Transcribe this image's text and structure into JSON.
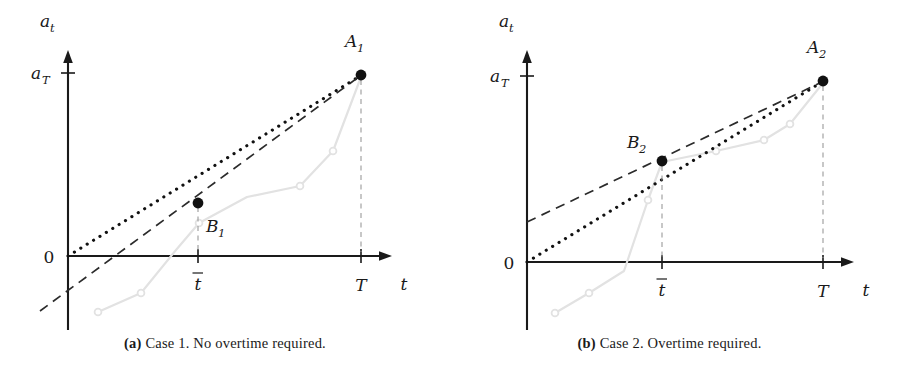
{
  "figure": {
    "background": "#ffffff",
    "ink": "#111111",
    "gray": "#e2e2e2",
    "guide_gray": "#9a9a9a"
  },
  "panels": [
    {
      "id": "a",
      "caption_tag": "(a)",
      "caption_text": "Case 1. No overtime required.",
      "axes": {
        "y_axis_label": "a_t",
        "y_axis_label_main": "a",
        "y_axis_label_sub": "t",
        "x_axis_label": "t",
        "origin_label": "0",
        "y_tick_label_main": "a",
        "y_tick_label_sub": "T",
        "x_ticks": [
          {
            "label_main": "t",
            "overbar": true,
            "label_sub": "",
            "x": 198
          },
          {
            "label_main": "T",
            "overbar": false,
            "label_sub": "",
            "x": 361
          }
        ],
        "origin_px": {
          "x": 68,
          "y": 256
        },
        "y_axis_top_px": 52,
        "y_axis_bottom_px": 330,
        "x_axis_right_px": 392,
        "aT_tick_y_px": 73
      },
      "points": [
        {
          "name": "A_1",
          "label_main": "A",
          "label_sub": "1",
          "x": 361,
          "y": 75,
          "label_x": 350,
          "label_y": 38
        },
        {
          "name": "B_1",
          "label_main": "B",
          "label_sub": "1",
          "x": 198,
          "y": 203,
          "label_x": 206,
          "label_y": 232
        }
      ],
      "dotted_line": {
        "x1": 68,
        "y1": 256,
        "x2": 360,
        "y2": 76,
        "note": "contract rate line from origin through A1"
      },
      "dashed_line": {
        "x1": 40,
        "y1": 311,
        "x2": 360,
        "y2": 76,
        "note": "actual progress trend line, negative intercept"
      },
      "gray_series": {
        "points": [
          [
            98,
            312
          ],
          [
            141,
            293
          ],
          [
            176,
            250
          ],
          [
            199,
            223
          ],
          [
            247,
            197
          ],
          [
            300,
            186
          ],
          [
            333,
            151
          ],
          [
            361,
            77
          ]
        ],
        "markers": [
          [
            98,
            312
          ],
          [
            141,
            293
          ],
          [
            199,
            223
          ],
          [
            300,
            186
          ],
          [
            333,
            151
          ]
        ]
      },
      "drop_lines": [
        {
          "x": 198,
          "y1": 207,
          "y2": 252
        },
        {
          "x": 361,
          "y1": 80,
          "y2": 252
        }
      ]
    },
    {
      "id": "b",
      "caption_tag": "(b)",
      "caption_text": "Case 2. Overtime required.",
      "axes": {
        "y_axis_label": "a_t",
        "y_axis_label_main": "a",
        "y_axis_label_sub": "t",
        "x_axis_label": "t",
        "origin_label": "0",
        "y_tick_label_main": "a",
        "y_tick_label_sub": "T",
        "x_ticks": [
          {
            "label_main": "t",
            "overbar": true,
            "label_sub": "",
            "x": 662
          },
          {
            "label_main": "T",
            "overbar": false,
            "label_sub": "",
            "x": 823
          }
        ],
        "origin_px": {
          "x": 527,
          "y": 262
        },
        "y_axis_top_px": 52,
        "y_axis_bottom_px": 330,
        "x_axis_right_px": 854,
        "aT_tick_y_px": 76
      },
      "points": [
        {
          "name": "A_2",
          "label_main": "A",
          "label_sub": "2",
          "x": 823,
          "y": 81,
          "label_x": 812,
          "label_y": 45
        },
        {
          "name": "B_2",
          "label_main": "B",
          "label_sub": "2",
          "x": 662,
          "y": 161,
          "label_x": 630,
          "label_y": 148
        }
      ],
      "dotted_line": {
        "x1": 527,
        "y1": 262,
        "x2": 822,
        "y2": 82,
        "note": "contract rate line from origin through A2"
      },
      "dashed_line": {
        "x1": 527,
        "y1": 222,
        "x2": 822,
        "y2": 82,
        "note": "actual progress trend line, positive intercept"
      },
      "gray_series": {
        "points": [
          [
            555,
            313
          ],
          [
            589,
            293
          ],
          [
            624,
            271
          ],
          [
            648,
            200
          ],
          [
            662,
            162
          ],
          [
            716,
            151
          ],
          [
            764,
            140
          ],
          [
            790,
            124
          ],
          [
            823,
            83
          ]
        ],
        "markers": [
          [
            555,
            313
          ],
          [
            589,
            293
          ],
          [
            648,
            200
          ],
          [
            716,
            151
          ],
          [
            764,
            140
          ],
          [
            790,
            124
          ]
        ]
      },
      "drop_lines": [
        {
          "x": 662,
          "y1": 166,
          "y2": 258
        },
        {
          "x": 823,
          "y1": 86,
          "y2": 258
        }
      ]
    }
  ]
}
